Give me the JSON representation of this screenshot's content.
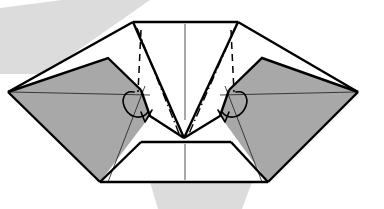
{
  "figure": {
    "canvas": {
      "width": 384,
      "height": 209
    },
    "caption": ""
  },
  "palette": {
    "paper_gray": "#a8a8a8",
    "paper_white": "#ffffff",
    "shadow_gray": "#dcdcdc",
    "ink_black": "#000000",
    "thin_line": "#1a1a1a",
    "axis_gray": "#3c3c3c",
    "background": "#ffffff"
  },
  "background_bands": [
    {
      "name": "upper-left-diagonal-shadow",
      "points": "0,8 62,0 150,0 44,74 0,74"
    },
    {
      "name": "lower-center-shadow",
      "points": "150,182 252,182 242,209 158,209"
    }
  ],
  "shapes": {
    "left_wing": {
      "name": "left-gray-wing",
      "fill": "paper_gray",
      "points": "8,92 108,58 141,90 150,116 100,182 8,92"
    },
    "right_wing": {
      "name": "right-gray-wing",
      "fill": "paper_gray",
      "points": "358,92 262,58 229,90 220,116 268,182 358,92"
    },
    "left_outer_flap": {
      "name": "left-white-outer-flap",
      "fill": "paper_white",
      "points": "8,92 133,22 141,90 108,58 8,92"
    },
    "right_outer_flap": {
      "name": "right-white-outer-flap",
      "fill": "paper_white",
      "points": "358,92 238,22 229,90 262,58 358,92"
    },
    "center_panel": {
      "name": "center-white-panel",
      "fill": "paper_white",
      "points": "133,22 238,22 184,138 133,22"
    },
    "left_inner_wedge": {
      "name": "left-inner-white-wedge",
      "fill": "paper_white",
      "points": "141,90 133,22 184,138 150,116 141,90"
    },
    "right_inner_wedge": {
      "name": "right-inner-white-wedge",
      "fill": "paper_white",
      "points": "229,90 238,22 184,138 220,116 229,90"
    },
    "bottom_trapezoid": {
      "name": "bottom-white-trapezoid",
      "fill": "paper_white",
      "points": "141,142 231,142 268,182 100,182 141,142"
    }
  },
  "heavy_edges": [
    {
      "name": "top-edge",
      "d": "M133,22 L238,22"
    },
    {
      "name": "left-upper-outer-edge",
      "d": "M133,22 L8,92"
    },
    {
      "name": "right-upper-outer-edge",
      "d": "M238,22 L358,92"
    },
    {
      "name": "left-wing-lower-edge",
      "d": "M8,92 L100,182"
    },
    {
      "name": "right-wing-lower-edge",
      "d": "M358,92 L268,182"
    },
    {
      "name": "trapezoid-bottom-edge",
      "d": "M100,182 L268,182"
    },
    {
      "name": "trapezoid-left-slant",
      "d": "M100,182 L141,142"
    },
    {
      "name": "trapezoid-right-slant",
      "d": "M268,182 L231,142"
    },
    {
      "name": "trapezoid-top-edge",
      "d": "M141,142 L231,142"
    },
    {
      "name": "left-center-diagonal",
      "d": "M133,22 L184,138"
    },
    {
      "name": "right-center-diagonal",
      "d": "M238,22 L184,138"
    },
    {
      "name": "left-flap-fold-edge",
      "d": "M8,92 L108,58 L141,90"
    },
    {
      "name": "right-flap-fold-edge",
      "d": "M358,92 L262,58 L229,90"
    },
    {
      "name": "left-flap-inner-edge",
      "d": "M141,90 L150,116 L184,138"
    },
    {
      "name": "right-flap-inner-edge",
      "d": "M229,90 L220,116 L184,138"
    }
  ],
  "thin_lines": [
    {
      "name": "left-wing-horizontal-crease",
      "d": "M10,92 L150,95"
    },
    {
      "name": "right-wing-horizontal-crease",
      "d": "M356,92 L220,95"
    },
    {
      "name": "left-wing-radial-crease",
      "d": "M108,182 L145,86"
    },
    {
      "name": "right-wing-radial-crease",
      "d": "M262,182 L225,86"
    }
  ],
  "creases": {
    "valley": [
      {
        "name": "left-valley-crease",
        "d": "M141,30 L138,92"
      },
      {
        "name": "right-valley-crease",
        "d": "M231,30 L234,92"
      }
    ],
    "mountain": [
      {
        "name": "left-mountain-crease",
        "d": "M137,28 L180,136"
      },
      {
        "name": "right-mountain-crease",
        "d": "M235,28 L188,136"
      }
    ]
  },
  "center_axes": [
    {
      "name": "upper-center-axis",
      "d": "M185,24 L185,120"
    },
    {
      "name": "lower-center-axis",
      "d": "M185,144 L185,180"
    }
  ],
  "hook_details": [
    {
      "name": "left-hook-curve",
      "d": "M134,92 C124,90 120,100 126,110 C131,118 142,120 148,112"
    },
    {
      "name": "left-hook-tail",
      "d": "M141,112 L145,122 L152,110"
    },
    {
      "name": "right-hook-curve",
      "d": "M236,92 C246,90 250,100 244,110 C239,118 228,120 222,112"
    },
    {
      "name": "right-hook-tail",
      "d": "M229,112 L225,122 L218,110"
    }
  ],
  "legend": {
    "valley_label": "valley fold (dashed)",
    "mountain_label": "mountain fold (dash-dot)",
    "edge_label": "paper edge",
    "gray_label": "reverse side of paper",
    "white_label": "front side of paper"
  }
}
